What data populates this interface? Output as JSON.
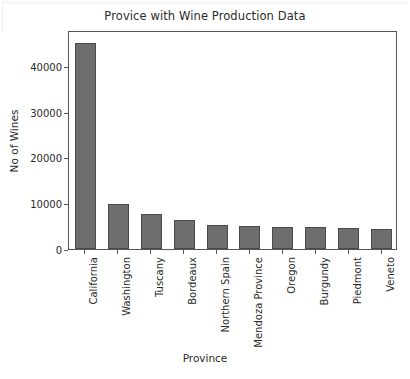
{
  "chart_data": {
    "type": "bar",
    "title": "Provice with Wine Production Data",
    "xlabel": "Province",
    "ylabel": "No of Wines",
    "categories": [
      "California",
      "Washington",
      "Tuscany",
      "Bordeaux",
      "Northern Spain",
      "Mendoza Province",
      "Oregon",
      "Burgundy",
      "Piedmont",
      "Veneto"
    ],
    "values": [
      44900,
      9800,
      7600,
      6300,
      5200,
      5000,
      4900,
      4700,
      4500,
      4300
    ],
    "ylim": [
      0,
      47800
    ],
    "yticks": [
      0,
      10000,
      20000,
      30000,
      40000
    ],
    "ytick_labels": [
      "0",
      "10000",
      "20000",
      "30000",
      "40000"
    ],
    "grid": false,
    "legend": false,
    "bar_color": "#6e6e6e",
    "bar_edge_color": "#4a4a4a",
    "axes_color": "#555555",
    "text_color": "#2b2b2b",
    "background": "#ffffff"
  }
}
